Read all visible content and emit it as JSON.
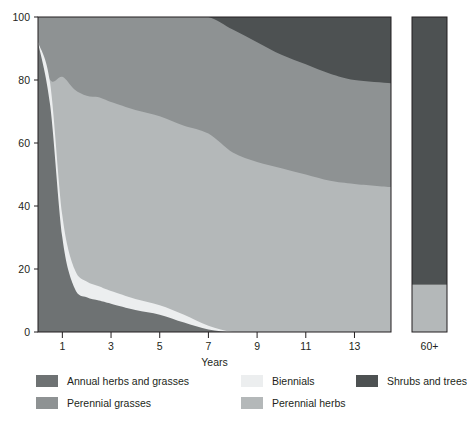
{
  "chart_data": {
    "type": "area",
    "title": "",
    "xlabel": "Years",
    "ylabel": "",
    "xlim": [
      0,
      14.5
    ],
    "ylim": [
      0,
      100
    ],
    "grid": false,
    "stacked": true,
    "legend_position": "bottom",
    "xticks": [
      "1",
      "3",
      "5",
      "7",
      "9",
      "11",
      "13"
    ],
    "xtick_values": [
      1,
      3,
      5,
      7,
      9,
      11,
      13
    ],
    "yticks": [
      "0",
      "20",
      "40",
      "60",
      "80",
      "100"
    ],
    "ytick_values": [
      0,
      20,
      40,
      60,
      80,
      100
    ],
    "x": [
      0,
      0.5,
      1,
      1.5,
      2,
      2.5,
      3,
      4,
      5,
      6,
      7,
      8,
      9,
      10,
      11,
      12,
      13,
      14.5
    ],
    "series": [
      {
        "name": "Annual herbs and grasses",
        "color": "#6e7273",
        "values": [
          92,
          72,
          30,
          14,
          11,
          10,
          9,
          7,
          5.5,
          3,
          0.8,
          0,
          0,
          0,
          0,
          0,
          0,
          0
        ]
      },
      {
        "name": "Biennials",
        "color": "#eceeef",
        "values": [
          0,
          7,
          7,
          6,
          5,
          4.5,
          4,
          3.5,
          3,
          2.5,
          1.2,
          0,
          0,
          0,
          0,
          0,
          0,
          0
        ]
      },
      {
        "name": "Perennial herbs",
        "color": "#b4b8b9",
        "values": [
          0,
          1,
          44,
          57,
          59,
          60,
          60,
          60,
          60,
          60,
          61,
          57,
          54,
          52,
          50,
          48,
          47,
          46
        ]
      },
      {
        "name": "Perennial grasses",
        "color": "#8e9293",
        "values": [
          8,
          20,
          19,
          23,
          25,
          25.5,
          27,
          29.5,
          31.5,
          34.5,
          37,
          39,
          38,
          36,
          35,
          34,
          33,
          33
        ]
      },
      {
        "name": "Shrubs and trees",
        "color": "#4d5152",
        "values": [
          0,
          0,
          0,
          0,
          0,
          0,
          0,
          0,
          0,
          0,
          0,
          4,
          8,
          12,
          15,
          18,
          20,
          21
        ]
      }
    ],
    "climax_panel": {
      "label": "60+",
      "segments": [
        {
          "name": "Perennial herbs",
          "color": "#b4b8b9",
          "value": 15
        },
        {
          "name": "Shrubs and trees",
          "color": "#4d5152",
          "value": 85
        }
      ]
    }
  },
  "legend": {
    "columns": [
      {
        "items": [
          {
            "label": "Annual herbs and grasses",
            "color": "#6e7273"
          },
          {
            "label": "Perennial grasses",
            "color": "#8e9293"
          }
        ]
      },
      {
        "items": [
          {
            "label": "Biennials",
            "color": "#eceeef"
          },
          {
            "label": "Perennial herbs",
            "color": "#b4b8b9"
          }
        ]
      },
      {
        "items": [
          {
            "label": "Shrubs and trees",
            "color": "#4d5152"
          }
        ]
      }
    ]
  }
}
